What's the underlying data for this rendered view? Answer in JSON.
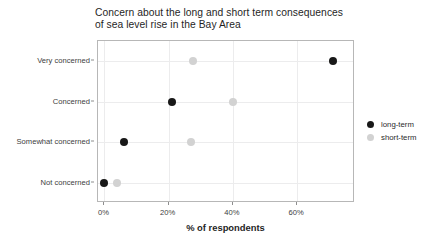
{
  "chart_data": {
    "type": "scatter",
    "title": "Concern about the long and short term consequences\nof sea level rise in the Bay Area",
    "xlabel": "% of respondents",
    "ylabel": "",
    "categories": [
      "Very concerned",
      "Concerned",
      "Somewhat concerned",
      "Not concerned"
    ],
    "xlim": [
      -2,
      78
    ],
    "xticks": [
      0,
      20,
      40,
      60
    ],
    "xticklabels": [
      "0%",
      "20%",
      "40%",
      "60%"
    ],
    "grid": true,
    "legend_position": "right",
    "series": [
      {
        "name": "long-term",
        "color": "#181818",
        "values": [
          71,
          21,
          6,
          0
        ],
        "points": [
          {
            "category": "Very concerned",
            "value": 71
          },
          {
            "category": "Concerned",
            "value": 21
          },
          {
            "category": "Somewhat concerned",
            "value": 6
          },
          {
            "category": "Not concerned",
            "value": 0
          }
        ]
      },
      {
        "name": "short-term",
        "color": "#d2d2d2",
        "values": [
          27.5,
          40,
          27,
          4
        ],
        "points": [
          {
            "category": "Very concerned",
            "value": 27.5
          },
          {
            "category": "Concerned",
            "value": 40
          },
          {
            "category": "Somewhat concerned",
            "value": 27
          },
          {
            "category": "Not concerned",
            "value": 4
          }
        ]
      }
    ]
  },
  "legend": {
    "items": [
      {
        "label": "long-term",
        "color": "#181818"
      },
      {
        "label": "short-term",
        "color": "#d2d2d2"
      }
    ]
  }
}
